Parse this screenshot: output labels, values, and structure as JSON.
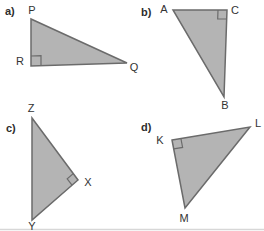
{
  "figure": {
    "width": 264,
    "height": 231,
    "colors": {
      "background": "#ffffff",
      "triangle_fill": "#b4b4b4",
      "triangle_stroke": "#6b6b6b",
      "label_text": "#333333",
      "bottom_rule": "#d7d7d7"
    },
    "bottom_rule_y": 229.5,
    "triangles": [
      {
        "id": "a",
        "part_label": {
          "text": "a)",
          "x": 5,
          "y": 15
        },
        "right_angle_at": "R",
        "right_angle_size": 10,
        "vertices": [
          {
            "name": "P",
            "x": 31,
            "y": 19,
            "label_x": 32,
            "label_y": 14
          },
          {
            "name": "R",
            "x": 31,
            "y": 66,
            "label_x": 20,
            "label_y": 65
          },
          {
            "name": "Q",
            "x": 127,
            "y": 63,
            "label_x": 134,
            "label_y": 71
          }
        ]
      },
      {
        "id": "b",
        "part_label": {
          "text": "b)",
          "x": 141,
          "y": 16
        },
        "right_angle_at": "C",
        "right_angle_size": 9,
        "vertices": [
          {
            "name": "A",
            "x": 173,
            "y": 10,
            "label_x": 164,
            "label_y": 13
          },
          {
            "name": "C",
            "x": 227,
            "y": 10,
            "label_x": 235,
            "label_y": 14
          },
          {
            "name": "B",
            "x": 224,
            "y": 97,
            "label_x": 225,
            "label_y": 109
          }
        ]
      },
      {
        "id": "c",
        "part_label": {
          "text": "c)",
          "x": 6,
          "y": 132
        },
        "right_angle_at": "X",
        "right_angle_size": 8,
        "vertices": [
          {
            "name": "Z",
            "x": 32,
            "y": 118,
            "label_x": 31,
            "label_y": 112
          },
          {
            "name": "X",
            "x": 78,
            "y": 180,
            "label_x": 88,
            "label_y": 186
          },
          {
            "name": "Y",
            "x": 32,
            "y": 220,
            "label_x": 32,
            "label_y": 230
          }
        ]
      },
      {
        "id": "d",
        "part_label": {
          "text": "d)",
          "x": 141,
          "y": 131
        },
        "right_angle_at": "K",
        "right_angle_size": 9,
        "vertices": [
          {
            "name": "K",
            "x": 172,
            "y": 140,
            "label_x": 160,
            "label_y": 144
          },
          {
            "name": "L",
            "x": 250,
            "y": 127,
            "label_x": 258,
            "label_y": 127
          },
          {
            "name": "M",
            "x": 185,
            "y": 208,
            "label_x": 184,
            "label_y": 222
          }
        ]
      }
    ]
  }
}
